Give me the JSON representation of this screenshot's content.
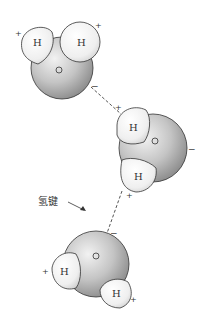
{
  "diagram": {
    "hydrogen_bond_label": "氢键",
    "molecules": [
      {
        "id": "molecule-1",
        "oxygen": {
          "label": "O",
          "cx": 62,
          "cy": 68,
          "r": 32
        },
        "hydrogens": [
          {
            "label": "H",
            "cx": 35,
            "cy": 43,
            "charge": "+"
          },
          {
            "label": "H",
            "cx": 80,
            "cy": 42,
            "charge": "+"
          }
        ],
        "oxygen_charge": "−"
      },
      {
        "id": "molecule-2",
        "oxygen": {
          "label": "O",
          "cx": 152,
          "cy": 148,
          "r": 34
        },
        "hydrogens": [
          {
            "label": "H",
            "cx": 132,
            "cy": 128,
            "charge": "+"
          },
          {
            "label": "H",
            "cx": 137,
            "cy": 174,
            "charge": "+"
          }
        ],
        "oxygen_charge": "−"
      },
      {
        "id": "molecule-3",
        "oxygen": {
          "label": "O",
          "cx": 96,
          "cy": 264,
          "r": 33
        },
        "hydrogens": [
          {
            "label": "H",
            "cx": 62,
            "cy": 272,
            "charge": "+"
          },
          {
            "label": "H",
            "cx": 116,
            "cy": 291,
            "charge": "+"
          }
        ],
        "oxygen_charge": "−"
      }
    ],
    "charges": {
      "plus": "+",
      "minus": "−"
    },
    "colors": {
      "oxygen_light": "#e8e8e8",
      "oxygen_dark": "#8c8c8c",
      "hydrogen_fill": "#f4f4f4",
      "outline": "#333333",
      "bond": "#555555"
    },
    "caption": ""
  }
}
